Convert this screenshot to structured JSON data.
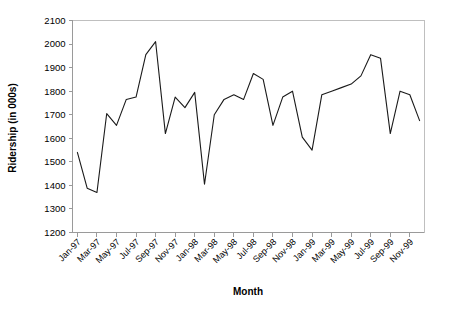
{
  "chart_data": {
    "type": "line",
    "title": "",
    "xlabel": "Month",
    "ylabel": "Ridership (in 000s)",
    "ylim": [
      1200,
      2100
    ],
    "ytick_step": 100,
    "yticks": [
      1200,
      1300,
      1400,
      1500,
      1600,
      1700,
      1800,
      1900,
      2000,
      2100
    ],
    "grid": false,
    "legend": false,
    "x": [
      "Jan-97",
      "Feb-97",
      "Mar-97",
      "Apr-97",
      "May-97",
      "Jun-97",
      "Jul-97",
      "Aug-97",
      "Sep-97",
      "Oct-97",
      "Nov-97",
      "Dec-97",
      "Jan-98",
      "Feb-98",
      "Mar-98",
      "Apr-98",
      "May-98",
      "Jun-98",
      "Jul-98",
      "Aug-98",
      "Sep-98",
      "Oct-98",
      "Nov-98",
      "Dec-98",
      "Jan-99",
      "Feb-99",
      "Mar-99",
      "Apr-99",
      "May-99",
      "Jun-99",
      "Jul-99",
      "Aug-99",
      "Sep-99",
      "Oct-99",
      "Nov-99",
      "Dec-99"
    ],
    "xtick_labels": [
      "Jan-97",
      "Mar-97",
      "May-97",
      "Jul-97",
      "Sep-97",
      "Nov-97",
      "Jan-98",
      "Mar-98",
      "May-98",
      "Jul-98",
      "Sep-98",
      "Nov-98",
      "Jan-99",
      "Mar-99",
      "May-99",
      "Jul-99",
      "Sep-99",
      "Nov-99"
    ],
    "xtick_indices": [
      0,
      2,
      4,
      6,
      8,
      10,
      12,
      14,
      16,
      18,
      20,
      22,
      24,
      26,
      28,
      30,
      32,
      34
    ],
    "series": [
      {
        "name": "Ridership",
        "values": [
          1540,
          1388,
          1370,
          1705,
          1655,
          1765,
          1775,
          1955,
          2010,
          1620,
          1775,
          1730,
          1795,
          1405,
          1700,
          1765,
          1785,
          1765,
          1875,
          1850,
          1655,
          1775,
          1800,
          1605,
          1550,
          1785,
          1800,
          1815,
          1830,
          1865,
          1955,
          1940,
          1620,
          1800,
          1785,
          1675
        ],
        "color": "#1a1a1a"
      }
    ]
  },
  "axes": {
    "y_title": "Ridership (in 000s)",
    "x_title": "Month"
  },
  "colors": {
    "line": "#1a1a1a",
    "axis": "#9a9a9a",
    "frame": "#bfbfbf",
    "background": "#ffffff",
    "text": "#000000"
  }
}
